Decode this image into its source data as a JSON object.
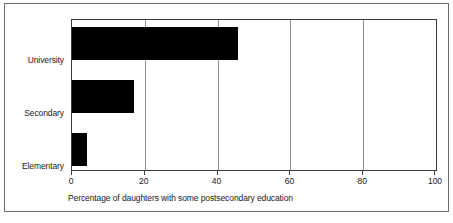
{
  "chart_data": {
    "type": "bar",
    "orientation": "horizontal",
    "title": "",
    "subtitle": "",
    "categories": [
      "University",
      "Secondary",
      "Elementary"
    ],
    "values": [
      45.5,
      17,
      4
    ],
    "series": [
      {
        "name": "Percentage of daughters with some postsecondary education",
        "values": [
          45.5,
          17,
          4
        ]
      }
    ],
    "xlabel": "Percentage of daughters with some postsecondary education",
    "ylabel": "",
    "xlim": [
      0,
      100
    ],
    "xticks": [
      0,
      20,
      40,
      60,
      80,
      100
    ],
    "xtick_labels": [
      "0",
      "20",
      "40",
      "60",
      "80",
      "100"
    ],
    "grid": "vertical",
    "legend": null,
    "bar_color": "#000000",
    "axis_color": "#3b3b3b",
    "grid_color": "#8f8f8f",
    "frame_color": "#6e6e6e",
    "background": "#ffffff"
  }
}
